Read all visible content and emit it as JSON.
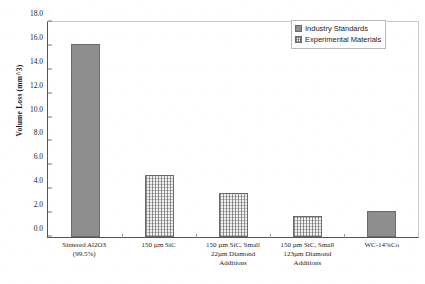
{
  "chart_data": {
    "type": "bar",
    "title": "",
    "xlabel": "",
    "ylabel": "Volume Loss (mm^3)",
    "ylim": [
      0.0,
      18.0
    ],
    "ytick_step": 2.0,
    "ytick_labels": [
      "18.0",
      "16.0",
      "14.0",
      "12.0",
      "10.0",
      "8.0",
      "6.0",
      "4.0",
      "2.0",
      "0.0"
    ],
    "ytick_values": [
      18.0,
      16.0,
      14.0,
      12.0,
      10.0,
      8.0,
      6.0,
      4.0,
      2.0,
      0.0
    ],
    "grid": false,
    "legend_position": "top-right",
    "legend": [
      {
        "label": "Industry Standards",
        "swatch": "solid"
      },
      {
        "label": "Experimental Materials",
        "swatch": "hatch"
      }
    ],
    "categories": [
      "Sintered Al2O3\n(99.5%)",
      "150 µm SiC",
      "150 µm SiC, Small\n22µm Diamond\nAdditions",
      "150 µm SiC, Small\n123µm Diamond\nAdditions",
      "WC-14%Co"
    ],
    "bars": [
      {
        "category_line1": "Sintered Al2O3",
        "category_line2": "(99.5%)",
        "category_line3": "",
        "value": 16.2,
        "series": "Industry Standards",
        "fill": "solid"
      },
      {
        "category_line1": "150 µm SiC",
        "category_line2": "",
        "category_line3": "",
        "value": 5.2,
        "series": "Experimental Materials",
        "fill": "hatch"
      },
      {
        "category_line1": "150 µm SiC, Small",
        "category_line2": "22µm Diamond",
        "category_line3": "Additions",
        "value": 3.7,
        "series": "Experimental Materials",
        "fill": "hatch"
      },
      {
        "category_line1": "150 µm SiC, Small",
        "category_line2": "123µm Diamond",
        "category_line3": "Additions",
        "value": 1.8,
        "series": "Experimental Materials",
        "fill": "hatch"
      },
      {
        "category_line1": "WC-14%Co",
        "category_line2": "",
        "category_line3": "",
        "value": 2.2,
        "series": "Industry Standards",
        "fill": "solid"
      }
    ],
    "colors": {
      "solid_fill": "#8e8e8e",
      "hatch_fill": "#f2f2f2",
      "bar_border": "#6a6a6a",
      "axis": "#555555",
      "text": "#1d1d1d"
    }
  }
}
